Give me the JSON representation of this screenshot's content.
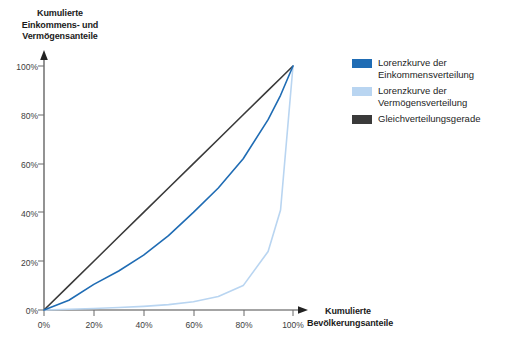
{
  "chart_data": {
    "type": "line",
    "title": "",
    "subtitle": "",
    "xlabel": "Kumulierte Bevölkerungsanteile",
    "ylabel": "Kumulierte Einkommens- und Vermögensanteile",
    "xlim": [
      0,
      100
    ],
    "ylim": [
      0,
      100
    ],
    "grid": false,
    "legend_position": "right",
    "xticks": [
      "0%",
      "20%",
      "40%",
      "60%",
      "80%",
      "100%"
    ],
    "yticks": [
      "0%",
      "20%",
      "40%",
      "60%",
      "80%",
      "100%"
    ],
    "x": [
      0,
      10,
      20,
      30,
      40,
      50,
      60,
      70,
      80,
      90,
      95,
      100
    ],
    "series": [
      {
        "name": "Lorenzkurve der Einkommensverteilung",
        "color": "#1f6cb4",
        "values": [
          0,
          4,
          10.5,
          16,
          22.5,
          30.5,
          40,
          50,
          62,
          78,
          88,
          100
        ]
      },
      {
        "name": "Lorenzkurve der Vermögensverteilung",
        "color": "#b9d5f1",
        "values": [
          0,
          0.3,
          0.6,
          1,
          1.5,
          2.2,
          3.4,
          5.5,
          10,
          24,
          41,
          100
        ]
      },
      {
        "name": "Gleichverteilungsgerade",
        "color": "#3a3a3a",
        "values": [
          0,
          10,
          20,
          30,
          40,
          50,
          60,
          70,
          80,
          90,
          95,
          100
        ]
      }
    ]
  },
  "axes": {
    "y_title_line1": "Kumulierte",
    "y_title_line2": "Einkommens- und",
    "y_title_line3": "Vermögensanteile",
    "x_title_line1": "Kumulierte",
    "x_title_line2": "Bevölkerungsanteile",
    "y_ticks": {
      "t0": "0%",
      "t20": "20%",
      "t40": "40%",
      "t60": "60%",
      "t80": "80%",
      "t100": "100%"
    },
    "x_ticks": {
      "t0": "0%",
      "t20": "20%",
      "t40": "40%",
      "t60": "60%",
      "t80": "80%",
      "t100": "100%"
    }
  },
  "legend": {
    "items": [
      {
        "line1": "Lorenzkurve der",
        "line2": "Einkommensverteilung",
        "color": "#1f6cb4"
      },
      {
        "line1": "Lorenzkurve der",
        "line2": "Vermögensverteilung",
        "color": "#b9d5f1"
      },
      {
        "line1": "Gleichverteilungsgerade",
        "line2": "",
        "color": "#3a3a3a"
      }
    ]
  },
  "colors": {
    "income_curve": "#1f6cb4",
    "wealth_curve": "#b9d5f1",
    "equality_line": "#3a3a3a",
    "axis": "#4a4a4a",
    "background": "#ffffff"
  }
}
